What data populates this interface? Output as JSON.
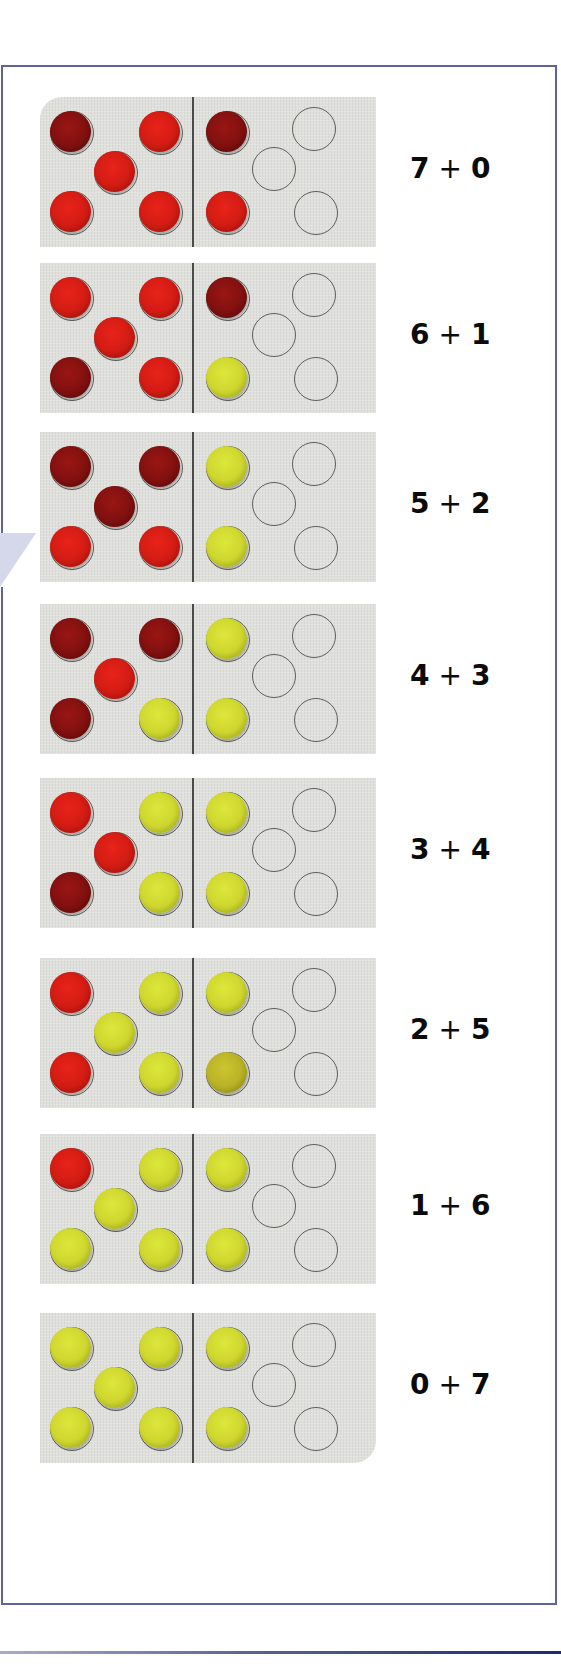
{
  "rows": [
    {
      "left": 7,
      "right": 0,
      "expr_a": "7",
      "op": "+",
      "expr_b": "0",
      "left_chips": [
        "dark",
        "red",
        "red",
        "red",
        "red"
      ],
      "right_chips": [
        "dark",
        "empty",
        "empty",
        "red",
        "empty"
      ]
    },
    {
      "left": 6,
      "right": 1,
      "expr_a": "6",
      "op": "+",
      "expr_b": "1",
      "left_chips": [
        "red",
        "red",
        "red",
        "dark",
        "red"
      ],
      "right_chips": [
        "dark",
        "empty",
        "empty",
        "yellow",
        "empty"
      ]
    },
    {
      "left": 5,
      "right": 2,
      "expr_a": "5",
      "op": "+",
      "expr_b": "2",
      "left_chips": [
        "dark",
        "dark",
        "dark",
        "red",
        "red"
      ],
      "right_chips": [
        "yellow",
        "empty",
        "empty",
        "yellow",
        "empty"
      ]
    },
    {
      "left": 4,
      "right": 3,
      "expr_a": "4",
      "op": "+",
      "expr_b": "3",
      "left_chips": [
        "dark",
        "dark",
        "red",
        "dark",
        "yellow"
      ],
      "right_chips": [
        "yellow",
        "empty",
        "empty",
        "yellow",
        "empty"
      ]
    },
    {
      "left": 3,
      "right": 4,
      "expr_a": "3",
      "op": "+",
      "expr_b": "4",
      "left_chips": [
        "red",
        "yellow",
        "red",
        "dark",
        "yellow"
      ],
      "right_chips": [
        "yellow",
        "empty",
        "empty",
        "yellow",
        "empty"
      ]
    },
    {
      "left": 2,
      "right": 5,
      "expr_a": "2",
      "op": "+",
      "expr_b": "5",
      "left_chips": [
        "red",
        "yellow",
        "yellow",
        "red",
        "yellow"
      ],
      "right_chips": [
        "yellow",
        "empty",
        "empty",
        "olive",
        "empty"
      ]
    },
    {
      "left": 1,
      "right": 6,
      "expr_a": "1",
      "op": "+",
      "expr_b": "6",
      "left_chips": [
        "red",
        "yellow",
        "yellow",
        "yellow",
        "yellow"
      ],
      "right_chips": [
        "yellow",
        "empty",
        "empty",
        "yellow",
        "empty"
      ]
    },
    {
      "left": 0,
      "right": 7,
      "expr_a": "0",
      "op": "+",
      "expr_b": "7",
      "left_chips": [
        "yellow",
        "yellow",
        "yellow",
        "yellow",
        "yellow"
      ],
      "right_chips": [
        "yellow",
        "empty",
        "empty",
        "yellow",
        "empty"
      ]
    }
  ],
  "colors": {
    "border": "#5d6598",
    "card": "#dfe0dc",
    "chip_dark_red": "#8a1312",
    "chip_red": "#dd1f16",
    "chip_yellow": "#d6de33",
    "pointer": "#d4d8ea"
  }
}
